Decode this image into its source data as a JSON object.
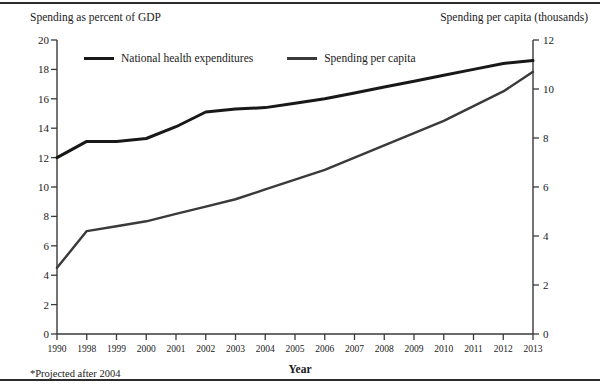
{
  "figure": {
    "left_axis_caption": "Spending as percent of GDP",
    "right_axis_caption": "Spending per capita (thousands)",
    "x_axis_title": "Year",
    "footnote": "*Projected after 2004"
  },
  "chart_data": {
    "type": "line",
    "title": "",
    "subtitle": "",
    "xlabel": "Year",
    "ylabel": "Spending as percent of GDP",
    "y2label": "Spending per capita (thousands)",
    "grid": false,
    "legend_position": "top-left-inside",
    "categories": [
      "1990",
      "1998",
      "1999",
      "2000",
      "2001",
      "2002",
      "2003",
      "2004",
      "2005",
      "2006",
      "2007",
      "2008",
      "2009",
      "2010",
      "2011",
      "2012",
      "2013"
    ],
    "x": [
      1990,
      1998,
      1999,
      2000,
      2001,
      2002,
      2003,
      2004,
      2005,
      2006,
      2007,
      2008,
      2009,
      2010,
      2011,
      2012,
      2013
    ],
    "ylim": [
      0,
      20
    ],
    "yticks": [
      0,
      2,
      4,
      6,
      8,
      10,
      12,
      14,
      16,
      18,
      20
    ],
    "y2lim": [
      0,
      12
    ],
    "y2ticks": [
      0,
      2,
      4,
      6,
      8,
      10,
      12
    ],
    "series": [
      {
        "name": "National health expenditures",
        "axis": "left",
        "units": "percent of GDP",
        "values": [
          12.0,
          13.1,
          13.1,
          13.3,
          14.1,
          15.1,
          15.3,
          15.4,
          15.7,
          16.0,
          16.4,
          16.8,
          17.2,
          17.6,
          18.0,
          18.4,
          18.6
        ]
      },
      {
        "name": "Spending per capita",
        "axis": "right",
        "units": "thousands of dollars",
        "values": [
          2.7,
          4.2,
          4.4,
          4.6,
          4.9,
          5.2,
          5.5,
          5.9,
          6.3,
          6.7,
          7.2,
          7.7,
          8.2,
          8.7,
          9.3,
          9.9,
          10.7
        ]
      }
    ],
    "annotations": [
      "*Projected after 2004"
    ]
  },
  "legend": {
    "items": [
      {
        "label": "National health expenditures"
      },
      {
        "label": "Spending per capita"
      }
    ]
  },
  "colors": {
    "series_1": "#181818",
    "series_2": "#3a3a3a",
    "axis": "#3a3a3a",
    "rule": "#2b2b2b"
  }
}
